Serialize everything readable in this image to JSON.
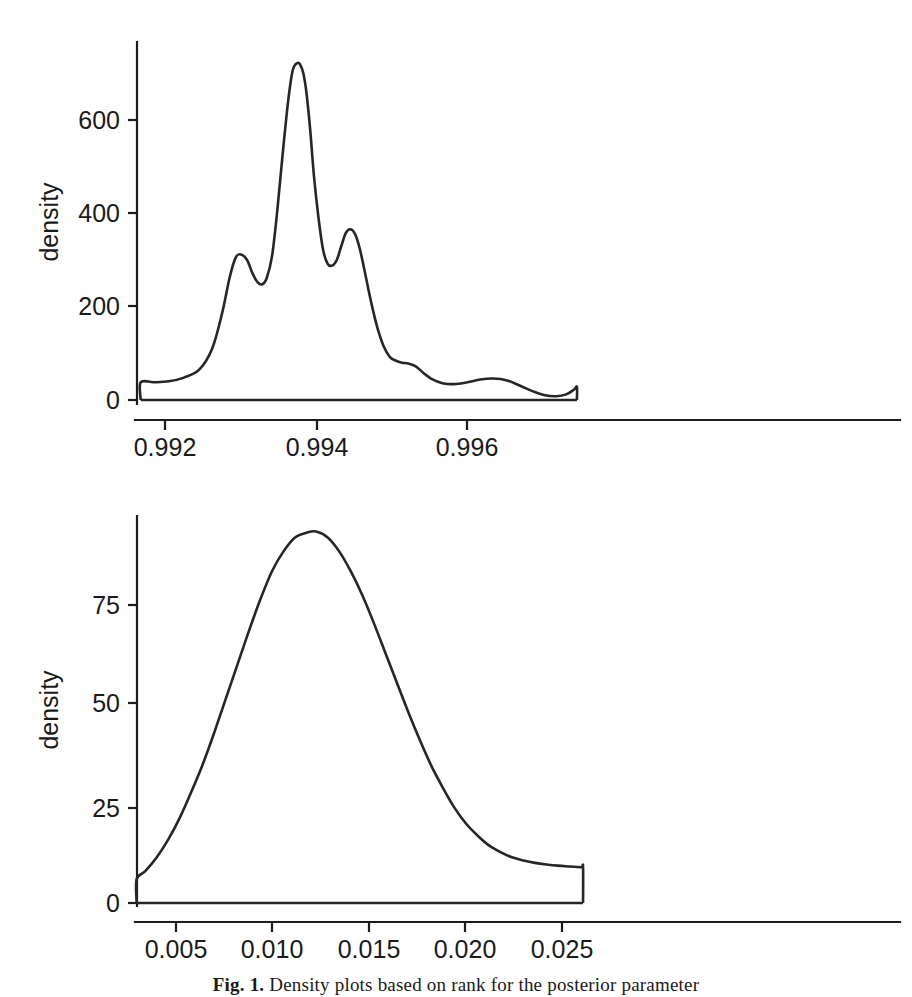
{
  "figure": {
    "caption_label": "Fig. 1.",
    "caption_text": "Density plots based on rank for the posterior parameter",
    "axis_title": "density"
  },
  "chart_data": [
    {
      "id": "top",
      "type": "line",
      "title": "",
      "xlabel": "",
      "ylabel": "density",
      "xlim": [
        0.99165,
        0.99745
      ],
      "ylim": [
        0,
        760
      ],
      "grid": false,
      "legend": "none",
      "xticks": [
        0.992,
        0.994,
        0.996
      ],
      "xticklabels": [
        "0.992",
        "0.994",
        "0.996"
      ],
      "yticks": [
        0,
        200,
        400,
        600
      ],
      "yticklabels": [
        "0",
        "200",
        "400",
        "600"
      ],
      "series": [
        {
          "name": "posterior density (rank 1)",
          "x": [
            0.99168,
            0.99168,
            0.99185,
            0.99205,
            0.99225,
            0.99245,
            0.99262,
            0.99275,
            0.99285,
            0.99293,
            0.993,
            0.99308,
            0.99315,
            0.99322,
            0.99328,
            0.99334,
            0.99341,
            0.99348,
            0.99355,
            0.99362,
            0.99368,
            0.99374,
            0.99378,
            0.99382,
            0.99386,
            0.99391,
            0.99396,
            0.99402,
            0.99408,
            0.99414,
            0.9942,
            0.99426,
            0.99432,
            0.99438,
            0.99444,
            0.9945,
            0.99456,
            0.99462,
            0.99468,
            0.99474,
            0.9948,
            0.99488,
            0.99496,
            0.99504,
            0.99512,
            0.9952,
            0.9953,
            0.9954,
            0.99552,
            0.99565,
            0.9958,
            0.99598,
            0.99615,
            0.99632,
            0.9965,
            0.99668,
            0.99685,
            0.997,
            0.99715,
            0.99728,
            0.99738,
            0.99742,
            0.99742
          ],
          "y": [
            0,
            38,
            38,
            40,
            48,
            65,
            110,
            185,
            262,
            305,
            312,
            300,
            272,
            252,
            248,
            262,
            310,
            410,
            530,
            640,
            706,
            722,
            718,
            700,
            660,
            580,
            480,
            390,
            322,
            292,
            288,
            300,
            330,
            358,
            366,
            356,
            326,
            282,
            234,
            190,
            152,
            114,
            92,
            84,
            80,
            78,
            72,
            58,
            44,
            36,
            34,
            38,
            44,
            46,
            42,
            30,
            18,
            10,
            8,
            12,
            22,
            28,
            0
          ]
        }
      ]
    },
    {
      "id": "bottom",
      "type": "line",
      "title": "",
      "xlabel": "",
      "ylabel": "density",
      "xlim": [
        0.0029,
        0.0263
      ],
      "ylim": [
        0,
        100
      ],
      "grid": false,
      "legend": "none",
      "xticks": [
        0.005,
        0.01,
        0.015,
        0.02,
        0.025
      ],
      "xticklabels": [
        "0.005",
        "0.010",
        "0.015",
        "0.020",
        "0.025"
      ],
      "yticks": [
        0,
        25,
        50,
        75
      ],
      "yticklabels": [
        "0",
        "25",
        "50",
        "75"
      ],
      "series": [
        {
          "name": "posterior density (rank 2)",
          "x": [
            0.00295,
            0.00295,
            0.0034,
            0.004,
            0.0046,
            0.0052,
            0.0058,
            0.0064,
            0.007,
            0.0076,
            0.0082,
            0.0088,
            0.0094,
            0.01,
            0.0106,
            0.0112,
            0.0118,
            0.0123,
            0.0129,
            0.0135,
            0.0141,
            0.0147,
            0.0153,
            0.0159,
            0.0165,
            0.0171,
            0.0177,
            0.0183,
            0.0189,
            0.0195,
            0.0201,
            0.0207,
            0.0213,
            0.0219,
            0.0225,
            0.0231,
            0.0237,
            0.0243,
            0.0249,
            0.0255,
            0.0261,
            0.0262,
            0.0262
          ],
          "y": [
            0,
            6.0,
            8.0,
            11.5,
            16.0,
            21.5,
            28.0,
            35.0,
            43.0,
            51.5,
            60.0,
            68.5,
            76.5,
            83.5,
            88.5,
            92.0,
            93.2,
            93.5,
            92.0,
            88.5,
            83.5,
            77.5,
            70.5,
            63.0,
            55.5,
            48.0,
            41.0,
            34.5,
            29.0,
            24.0,
            20.0,
            17.0,
            14.5,
            12.8,
            11.5,
            10.7,
            10.1,
            9.7,
            9.4,
            9.2,
            9.0,
            9.0,
            0
          ]
        }
      ]
    }
  ]
}
